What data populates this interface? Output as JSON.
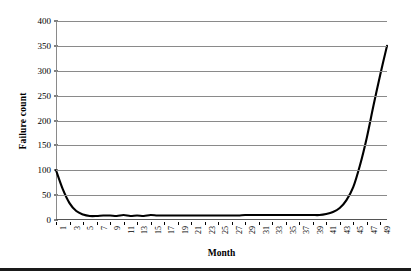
{
  "chart_data": {
    "type": "line",
    "title": "",
    "subtitle": "",
    "xlabel": "Month",
    "ylabel": "Failure count",
    "xlim": [
      1,
      50
    ],
    "ylim": [
      0,
      400
    ],
    "y_ticks": [
      0,
      50,
      100,
      150,
      200,
      250,
      300,
      350,
      400
    ],
    "y_tick_labels": [
      "0",
      "50",
      "100",
      "150",
      "200",
      "250",
      "300",
      "350",
      "400"
    ],
    "x_ticks": [
      1,
      3,
      5,
      7,
      9,
      11,
      13,
      15,
      17,
      19,
      21,
      23,
      25,
      27,
      29,
      31,
      33,
      35,
      37,
      39,
      41,
      43,
      45,
      47,
      49
    ],
    "x_tick_labels": [
      "1",
      "3",
      "5",
      "7",
      "9",
      "11",
      "13",
      "15",
      "17",
      "19",
      "21",
      "23",
      "25",
      "27",
      "29",
      "31",
      "33",
      "35",
      "37",
      "39",
      "41",
      "43",
      "45",
      "47",
      "49"
    ],
    "x_tick_rotation": -90,
    "grid": "horizontal",
    "legend": "none",
    "line_color": "#000000",
    "grid_color": "#8a8a8a",
    "series": [
      {
        "name": "Failure count",
        "x": [
          1,
          2,
          3,
          4,
          5,
          6,
          7,
          8,
          9,
          10,
          11,
          12,
          13,
          14,
          15,
          16,
          17,
          18,
          19,
          20,
          21,
          22,
          23,
          24,
          25,
          26,
          27,
          28,
          29,
          30,
          31,
          32,
          33,
          34,
          35,
          36,
          37,
          38,
          39,
          40,
          41,
          42,
          43,
          44,
          45,
          46,
          47,
          48,
          49,
          50
        ],
        "values": [
          100,
          62,
          34,
          18,
          11,
          8,
          8,
          9,
          9,
          8,
          10,
          8,
          9,
          8,
          10,
          9,
          9,
          9,
          9,
          9,
          9,
          9,
          9,
          9,
          9,
          9,
          9,
          9,
          10,
          10,
          10,
          10,
          10,
          10,
          10,
          10,
          10,
          10,
          10,
          10,
          12,
          16,
          24,
          40,
          66,
          110,
          165,
          230,
          292,
          350
        ]
      }
    ]
  }
}
